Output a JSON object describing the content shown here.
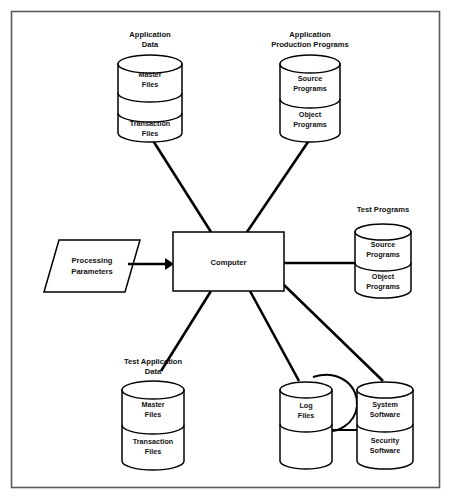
{
  "diagram": {
    "type": "system-flow-diagram",
    "colors": {
      "background": "#ffffff",
      "stroke": "#000000",
      "frame": "#5a5a5a",
      "text": "#111111"
    },
    "center": {
      "label": "Computer",
      "shape": "rectangle"
    },
    "input": {
      "label": "Processing Parameters",
      "shape": "parallelogram",
      "arrow": "arrow-right"
    },
    "stores": [
      {
        "id": "application-data",
        "title": "Application Data",
        "shape": "cylinder",
        "segments": [
          "Master Files",
          "",
          "Transaction Files"
        ]
      },
      {
        "id": "application-production-programs",
        "title": "Application Production Programs",
        "shape": "cylinder",
        "segments": [
          "Source Programs",
          "Object Programs"
        ]
      },
      {
        "id": "test-programs",
        "title": "Test Programs",
        "shape": "cylinder",
        "segments": [
          "Source Programs",
          "Object Programs"
        ]
      },
      {
        "id": "test-application-data",
        "title": "Test Application Data",
        "shape": "cylinder",
        "segments": [
          "Master Files",
          "Transaction Files"
        ]
      },
      {
        "id": "log-files",
        "title": "",
        "shape": "cylinder",
        "segments": [
          "Log Files",
          ""
        ]
      },
      {
        "id": "system-software",
        "title": "",
        "shape": "cylinder",
        "segments": [
          "System Software",
          "Security Software"
        ]
      }
    ],
    "labels": {
      "application_data_line1": "Application",
      "application_data_line2": "Data",
      "application_production_line1": "Application",
      "application_production_line2": "Production Programs",
      "test_programs": "Test Programs",
      "test_application_data_line1": "Test Application",
      "test_application_data_line2": "Data",
      "master_files_line1": "Master",
      "master_files_line2": "Files",
      "transaction_files_line1": "Transaction",
      "transaction_files_line2": "Files",
      "source_programs_line1": "Source",
      "source_programs_line2": "Programs",
      "object_programs_line1": "Object",
      "object_programs_line2": "Programs",
      "log_files_line1": "Log",
      "log_files_line2": "Files",
      "system_software_line1": "System",
      "system_software_line2": "Software",
      "security_software_line1": "Security",
      "security_software_line2": "Software",
      "processing_parameters_line1": "Processing",
      "processing_parameters_line2": "Parameters",
      "computer": "Computer"
    }
  }
}
